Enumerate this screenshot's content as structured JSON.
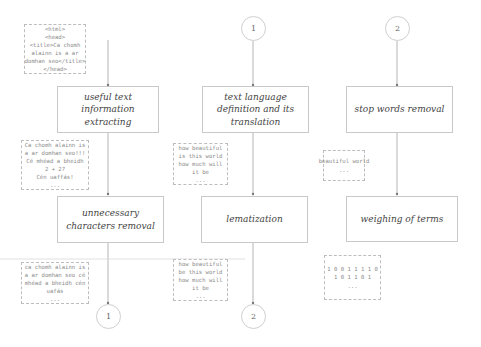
{
  "diagram": {
    "colors": {
      "box_border": "#c9c9c9",
      "note_border": "#bdbdbd",
      "line": "#b5b5b5",
      "text": "#444444",
      "note_text": "#8a8a8a"
    },
    "columns": [
      {
        "top_note": {
          "lines": [
            "<html>",
            "<head>",
            "<title>Ca chomh",
            "alainn is a ar",
            "domhan seo</title>",
            "</head>"
          ]
        },
        "step1": "useful text information extracting",
        "note1": {
          "lines": [
            "Ca chomh alainn is",
            "a ar domhan seo!!!",
            "Cé mhéad a bheidh",
            "2 + 2?",
            "Cén uaffás!",
            "..."
          ]
        },
        "step2": "unnecessary characters removal",
        "note2": {
          "lines": [
            "ca chomh alainn is",
            "a ar domhan seo cé",
            "mhéad a bheidh cén",
            "uafás",
            "..."
          ]
        },
        "end_connector": "1"
      },
      {
        "start_connector": "1",
        "step1": "text language definition and its translation",
        "note1": {
          "lines": [
            "how beautiful",
            "is this world",
            "how much will",
            "it be",
            "..."
          ]
        },
        "step2": "lematization",
        "note2": {
          "lines": [
            "how beautiful",
            "be this world",
            "how much will",
            "it be",
            "..."
          ]
        },
        "end_connector": "2"
      },
      {
        "start_connector": "2",
        "step1": "stop words removal",
        "note1": {
          "lines": [
            "beautiful world",
            "..."
          ]
        },
        "step2": "weighing of terms",
        "note2": {
          "lines": [
            "1 0 0 1 1 1 1 0",
            "1 0 1 1 0 1",
            "..."
          ]
        }
      }
    ]
  }
}
